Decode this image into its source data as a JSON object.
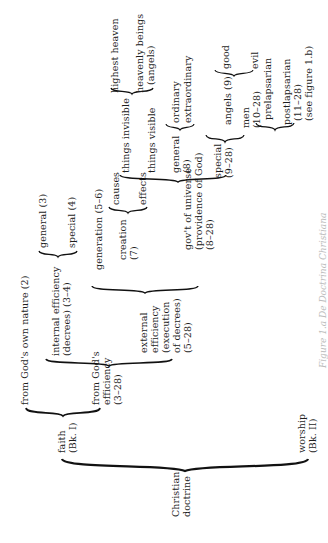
{
  "diagram": {
    "orientation": "rotated-90-ccw",
    "root": "Christian doctrine",
    "nodes": {
      "root": "Christian",
      "root2": "doctrine",
      "faith": "faith",
      "faith_ref": "(Bk. I)",
      "worship": "worship",
      "worship_ref": "(Bk. II)",
      "own_nature": "from God's own nature (2)",
      "efficiency": "from God's",
      "efficiency2": "efficiency",
      "efficiency_ref": "(3–28)",
      "internal": "internal efficiency",
      "internal2": "(decrees) (3–4)",
      "general3": "general (3)",
      "special4": "special (4)",
      "external": "external",
      "external2": "efficiency",
      "external3": "(execution",
      "external4": "of decrees)",
      "external_ref": "(5–28)",
      "generation": "generation (5–6)",
      "creation": "creation",
      "creation_ref": "(7)",
      "causes": "causes",
      "effects": "effects",
      "govt": "gov't of universe",
      "govt2": "(providence of God)",
      "govt_ref": "(8–28)",
      "invisible": "things invisible",
      "visible": "things visible",
      "highest_heaven": "highest heaven",
      "heavenly_beings": "heavenly beings",
      "angels_paren": "(angels)",
      "general8": "general",
      "general8_ref": "(8)",
      "ordinary": "ordinary",
      "extraordinary": "extraordinary",
      "special9": "special",
      "special9_ref": "(9–28)",
      "angels9": "angels (9)",
      "good": "good",
      "evil": "evil",
      "men": "men",
      "men_ref": "(10–28)",
      "prelapsarian": "prelapsarian",
      "postlapsarian": "postlapsarian",
      "postlapsarian_ref": "(11–28)",
      "see_fig": "(see figure 1.b)"
    },
    "caption": "Figure 1.a  De Doctrina Christiana"
  }
}
